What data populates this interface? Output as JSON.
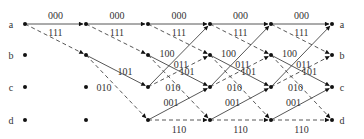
{
  "diagram": {
    "type": "trellis",
    "states": [
      "a",
      "b",
      "c",
      "d"
    ],
    "columns_x": [
      25,
      86,
      148,
      210,
      271,
      332
    ],
    "rows_y": [
      24,
      55,
      87,
      120
    ],
    "transitions_legend": {
      "solid": "input 0",
      "dashed": "input 1"
    },
    "branch_labels": {
      "a_to_a": "000",
      "a_to_b": "111",
      "b_to_c": "101",
      "b_to_d": "010",
      "c_to_a": "100",
      "c_to_b": "011",
      "d_to_c": "001",
      "d_to_d": "110"
    },
    "left_labels": [
      "a",
      "b",
      "c",
      "d"
    ],
    "right_labels": [
      "a",
      "b",
      "c",
      "d"
    ]
  }
}
